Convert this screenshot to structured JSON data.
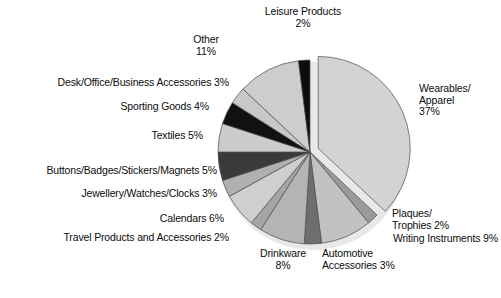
{
  "chart_data": {
    "type": "pie",
    "title": "",
    "subtitle": "",
    "xlabel": "",
    "ylabel": "",
    "legend_position": "none",
    "grid": false,
    "units": "percent",
    "categories": [
      "Wearables/Apparel",
      "Plaques/Trophies",
      "Writing Instruments",
      "Automotive Accessories",
      "Drinkware",
      "Travel Products and Accessories",
      "Calendars",
      "Jewellery/Watches/Clocks",
      "Buttons/Badges/Stickers/Magnets",
      "Textiles",
      "Sporting Goods",
      "Desk/Office/Business Accessories",
      "Other",
      "Leisure Products"
    ],
    "values": [
      37,
      2,
      9,
      3,
      8,
      2,
      6,
      3,
      5,
      5,
      4,
      3,
      11,
      2
    ],
    "colors": [
      "#d3d3d3",
      "#9a9a9a",
      "#c2c2c2",
      "#6e6e6e",
      "#b4b4b4",
      "#a5a5a5",
      "#cfcfcf",
      "#b0b0b0",
      "#3a3a3a",
      "#cccccc",
      "#111111",
      "#c8c8c8",
      "#cdcdcd",
      "#0d0d0d"
    ],
    "exploded": [
      true,
      false,
      false,
      false,
      false,
      false,
      false,
      false,
      false,
      false,
      false,
      false,
      false,
      false
    ],
    "start_angle_deg": -90,
    "direction": "clockwise",
    "slice_outline_color": "#4d4d4d",
    "background_color": "#ffffff"
  },
  "labels": [
    {
      "name": "leisure-products",
      "text": "Leisure Products\n2%",
      "align": "center",
      "x": 253,
      "y": 6,
      "w": 100
    },
    {
      "name": "other",
      "text": "Other\n11%",
      "align": "center",
      "x": 175,
      "y": 34,
      "w": 62
    },
    {
      "name": "desk-office-business-accessories",
      "text": "Desk/Office/Business Accessories 3%",
      "align": "right",
      "x": 10,
      "y": 77,
      "w": 219
    },
    {
      "name": "sporting-goods",
      "text": "Sporting Goods 4%",
      "align": "right",
      "x": 70,
      "y": 101,
      "w": 139
    },
    {
      "name": "textiles",
      "text": "Textiles 5%",
      "align": "right",
      "x": 106,
      "y": 130,
      "w": 97
    },
    {
      "name": "buttons-badges-stickers-magnets",
      "text": "Buttons/Badges/Stickers/Magnets 5%",
      "align": "right",
      "x": 8,
      "y": 165,
      "w": 209
    },
    {
      "name": "jewellery-watches-clocks",
      "text": "Jewellery/Watches/Clocks 3%",
      "align": "right",
      "x": 48,
      "y": 188,
      "w": 169
    },
    {
      "name": "calendars",
      "text": "Calendars 6%",
      "align": "right",
      "x": 110,
      "y": 213,
      "w": 114
    },
    {
      "name": "travel-products-and-accessories",
      "text": "Travel Products and Accessories 2%",
      "align": "right",
      "x": 28,
      "y": 232,
      "w": 201
    },
    {
      "name": "drinkware",
      "text": "Drinkware\n8%",
      "align": "center",
      "x": 250,
      "y": 248,
      "w": 66
    },
    {
      "name": "automotive-accessories",
      "text": "Automotive\nAccessories 3%",
      "align": "left",
      "x": 322,
      "y": 248,
      "w": 92
    },
    {
      "name": "wearables-apparel",
      "text": "Wearables/\nApparel\n37%",
      "align": "left",
      "x": 419,
      "y": 83,
      "w": 76
    },
    {
      "name": "plaques-trophies",
      "text": "Plaques/\nTrophies 2%",
      "align": "left",
      "x": 392,
      "y": 208,
      "w": 80
    },
    {
      "name": "writing-instruments",
      "text": "Writing Instruments 9%",
      "align": "right",
      "x": 358,
      "y": 233,
      "w": 140
    }
  ]
}
